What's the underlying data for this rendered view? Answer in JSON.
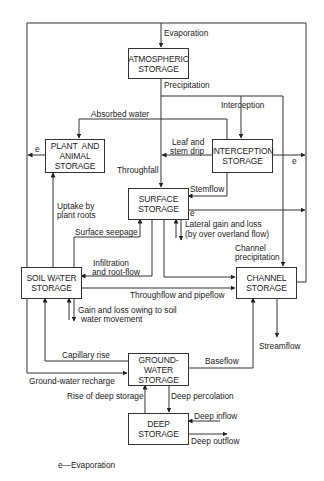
{
  "diagram": {
    "nodes": {
      "atmospheric": {
        "line1": "ATMOSPHERIC",
        "line2": "STORAGE"
      },
      "plant": {
        "line1": "PLANT  AND",
        "line2": "ANIMAL",
        "line3": "STORAGE"
      },
      "interception": {
        "line1": "INTERCEPTION",
        "line2": "STORAGE"
      },
      "surface": {
        "line1": "SURFACE",
        "line2": "STORAGE"
      },
      "soil": {
        "line1": "SOIL WATER",
        "line2": "STORAGE"
      },
      "channel": {
        "line1": "CHANNEL",
        "line2": "STORAGE"
      },
      "groundwater": {
        "line1": "GROUND-",
        "line2": "WATER",
        "line3": "STORAGE"
      },
      "deep": {
        "line1": "DEEP",
        "line2": "STORAGE"
      }
    },
    "flows": {
      "evaporation": "Evaporation",
      "precipitation": "Precipitation",
      "interception": "Interception",
      "absorbed_water": "Absorbed water",
      "leaf_stem_drip_1": "Leaf and",
      "leaf_stem_drip_2": "stem drip",
      "throughfall": "Throughfall",
      "stemflow": "Stemflow",
      "e_plant": "e",
      "e_interception": "e",
      "e_surface": "e",
      "uptake_1": "Uptake by",
      "uptake_2": "plant roots",
      "surface_seepage": "Surface seepage",
      "lateral_1": "Lateral gain and loss",
      "lateral_2": "(by over overland flow)",
      "channel_precip_1": "Channel",
      "channel_precip_2": "precipitation",
      "infiltration_1": "Infiltration",
      "infiltration_2": "and root-flow",
      "throughflow": "Throughflow and pipeflow",
      "gain_loss_1": "Gain and loss owing to soil",
      "gain_loss_2": "water movement",
      "streamflow": "Streamflow",
      "capillary_rise": "Capillary rise",
      "baseflow": "Baseflow",
      "gw_recharge": "Ground-water recharge",
      "rise_deep": "Rise of deep storage",
      "deep_percolation": "Deep percolation",
      "deep_inflow": "Deep inflow",
      "deep_outflow": "Deep outflow"
    },
    "legend": "e—Evaporation"
  }
}
